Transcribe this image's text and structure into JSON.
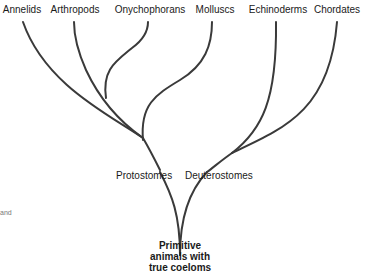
{
  "diagram": {
    "type": "phylogenetic-tree",
    "leaves": [
      {
        "label": "Annelids"
      },
      {
        "label": "Arthropods"
      },
      {
        "label": "Onychophorans"
      },
      {
        "label": "Molluscs"
      },
      {
        "label": "Echinoderms"
      },
      {
        "label": "Chordates"
      }
    ],
    "groups": {
      "protostomes": "Protostomes",
      "deuterostomes": "Deuterostomes"
    },
    "root": {
      "line1": "Primitive",
      "line2": "animals with",
      "line3": "true coeloms"
    },
    "margin_fragment": "and",
    "line_color": "#3a3a3a"
  }
}
